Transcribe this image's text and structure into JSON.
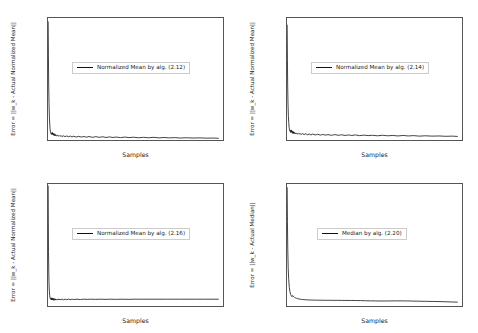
{
  "figure": {
    "panel_count": 4,
    "background": "#ffffff",
    "line_color": "#111111"
  },
  "chart_data": [
    {
      "id": "top-left",
      "type": "line",
      "title": "",
      "xlabel": "Samples",
      "ylabel": "Error = ||w_k - Actual Normalized Mean||",
      "xlim": [
        0,
        2050
      ],
      "ylim": [
        0.0,
        0.87
      ],
      "xticks": [
        0,
        250,
        500,
        750,
        1000,
        1250,
        1500,
        1750,
        2000
      ],
      "xticklabels": [
        "0",
        "250",
        "500",
        "750",
        "1000",
        "1250",
        "1500",
        "1750",
        "2000"
      ],
      "yticks": [
        0.0,
        0.2,
        0.4,
        0.6,
        0.8
      ],
      "yticklabels": [
        "0.0",
        "0.2",
        "0.4",
        "0.6",
        "0.8"
      ],
      "grid": false,
      "legend": {
        "label": "Normalized Mean by alg. (2.12)",
        "position": "center-left"
      },
      "series": [
        {
          "name": "Normalized Mean by alg. (2.12)",
          "x": [
            2,
            5,
            8,
            12,
            16,
            20,
            25,
            30,
            35,
            40,
            45,
            50,
            55,
            60,
            65,
            70,
            75,
            80,
            85,
            90,
            100,
            110,
            120,
            130,
            140,
            150,
            165,
            180,
            200,
            220,
            240,
            260,
            280,
            300,
            330,
            360,
            390,
            420,
            450,
            480,
            520,
            560,
            600,
            640,
            680,
            720,
            760,
            800,
            850,
            900,
            950,
            1000,
            1060,
            1120,
            1180,
            1240,
            1300,
            1360,
            1420,
            1480,
            1550,
            1620,
            1700,
            1780,
            1860,
            1940,
            2000
          ],
          "y": [
            0.845,
            0.6,
            0.4,
            0.26,
            0.17,
            0.115,
            0.075,
            0.055,
            0.045,
            0.05,
            0.038,
            0.055,
            0.04,
            0.048,
            0.034,
            0.046,
            0.032,
            0.042,
            0.03,
            0.038,
            0.029,
            0.035,
            0.027,
            0.033,
            0.026,
            0.031,
            0.025,
            0.03,
            0.024,
            0.029,
            0.023,
            0.028,
            0.022,
            0.027,
            0.021,
            0.026,
            0.021,
            0.025,
            0.02,
            0.025,
            0.019,
            0.024,
            0.019,
            0.023,
            0.018,
            0.022,
            0.018,
            0.021,
            0.017,
            0.021,
            0.017,
            0.02,
            0.016,
            0.019,
            0.016,
            0.019,
            0.015,
            0.018,
            0.015,
            0.017,
            0.014,
            0.016,
            0.014,
            0.015,
            0.013,
            0.014,
            0.012
          ]
        }
      ]
    },
    {
      "id": "top-right",
      "type": "line",
      "title": "",
      "xlabel": "Samples",
      "ylabel": "Error = ||w_k - Actual Normalized Mean||",
      "xlim": [
        0,
        2050
      ],
      "ylim": [
        -0.01,
        0.715
      ],
      "xticks": [
        0,
        250,
        500,
        750,
        1000,
        1250,
        1500,
        1750,
        2000
      ],
      "xticklabels": [
        "0",
        "250",
        "500",
        "750",
        "1000",
        "1250",
        "1500",
        "1750",
        "2000"
      ],
      "yticks": [
        0.0,
        0.1,
        0.2,
        0.3,
        0.4,
        0.5,
        0.6,
        0.7
      ],
      "yticklabels": [
        "0.0",
        "0.1",
        "0.2",
        "0.3",
        "0.4",
        "0.5",
        "0.6",
        "0.7"
      ],
      "grid": false,
      "legend": {
        "label": "Normalized Mean by alg. (2.14)",
        "position": "center-left"
      },
      "series": [
        {
          "name": "Normalized Mean by alg. (2.14)",
          "x": [
            2,
            5,
            8,
            12,
            16,
            20,
            25,
            30,
            35,
            40,
            45,
            50,
            55,
            60,
            65,
            70,
            75,
            80,
            85,
            90,
            100,
            110,
            120,
            130,
            140,
            150,
            165,
            180,
            200,
            220,
            240,
            260,
            280,
            300,
            330,
            360,
            390,
            420,
            450,
            480,
            520,
            560,
            600,
            640,
            680,
            720,
            760,
            800,
            850,
            900,
            950,
            1000,
            1060,
            1120,
            1180,
            1240,
            1300,
            1360,
            1420,
            1480,
            1550,
            1620,
            1700,
            1780,
            1860,
            1940,
            2000
          ],
          "y": [
            0.675,
            0.47,
            0.31,
            0.2,
            0.135,
            0.095,
            0.065,
            0.05,
            0.042,
            0.048,
            0.034,
            0.05,
            0.036,
            0.044,
            0.03,
            0.042,
            0.029,
            0.038,
            0.028,
            0.034,
            0.026,
            0.032,
            0.025,
            0.03,
            0.024,
            0.029,
            0.023,
            0.028,
            0.022,
            0.027,
            0.021,
            0.026,
            0.02,
            0.025,
            0.02,
            0.024,
            0.019,
            0.023,
            0.019,
            0.022,
            0.018,
            0.022,
            0.018,
            0.021,
            0.017,
            0.02,
            0.017,
            0.02,
            0.016,
            0.019,
            0.016,
            0.018,
            0.015,
            0.018,
            0.015,
            0.017,
            0.014,
            0.017,
            0.014,
            0.016,
            0.013,
            0.015,
            0.013,
            0.014,
            0.012,
            0.013,
            0.011
          ]
        }
      ]
    },
    {
      "id": "bottom-left",
      "type": "line",
      "title": "",
      "xlabel": "Samples",
      "ylabel": "Error = ||w_k - Actual Normalized Mean||",
      "xlim": [
        0,
        2050
      ],
      "ylim": [
        0.075,
        0.845
      ],
      "xticks": [
        0,
        250,
        500,
        750,
        1000,
        1250,
        1500,
        1750,
        2000
      ],
      "xticklabels": [
        "0",
        "250",
        "500",
        "750",
        "1000",
        "1250",
        "1500",
        "1750",
        "2000"
      ],
      "yticks": [
        0.1,
        0.2,
        0.3,
        0.4,
        0.5,
        0.6,
        0.7,
        0.8
      ],
      "yticklabels": [
        "0.1",
        "0.2",
        "0.3",
        "0.4",
        "0.5",
        "0.6",
        "0.7",
        "0.8"
      ],
      "grid": false,
      "legend": {
        "label": "Normalized Mean by alg. (2.16)",
        "position": "center-left"
      },
      "series": [
        {
          "name": "Normalized Mean by alg. (2.16)",
          "x": [
            2,
            4,
            6,
            9,
            12,
            16,
            20,
            25,
            30,
            35,
            40,
            45,
            50,
            55,
            60,
            65,
            70,
            75,
            80,
            85,
            90,
            100,
            110,
            120,
            130,
            140,
            150,
            165,
            180,
            200,
            220,
            240,
            260,
            280,
            300,
            340,
            380,
            420,
            460,
            500,
            560,
            620,
            680,
            740,
            800,
            870,
            940,
            1010,
            1080,
            1150,
            1230,
            1310,
            1390,
            1470,
            1550,
            1640,
            1730,
            1820,
            1910,
            2000
          ],
          "y": [
            0.835,
            0.6,
            0.42,
            0.29,
            0.215,
            0.165,
            0.14,
            0.124,
            0.118,
            0.125,
            0.113,
            0.127,
            0.114,
            0.124,
            0.112,
            0.122,
            0.111,
            0.121,
            0.112,
            0.12,
            0.113,
            0.119,
            0.112,
            0.12,
            0.113,
            0.119,
            0.114,
            0.119,
            0.114,
            0.118,
            0.115,
            0.119,
            0.115,
            0.118,
            0.116,
            0.118,
            0.116,
            0.118,
            0.117,
            0.118,
            0.117,
            0.118,
            0.117,
            0.118,
            0.117,
            0.118,
            0.117,
            0.118,
            0.118,
            0.118,
            0.118,
            0.118,
            0.118,
            0.118,
            0.118,
            0.118,
            0.118,
            0.118,
            0.118,
            0.118
          ]
        }
      ]
    },
    {
      "id": "bottom-right",
      "type": "line",
      "title": "",
      "xlabel": "Samples",
      "ylabel": "Error = ||w_k - Actual Median||",
      "xlim": [
        0,
        2050
      ],
      "ylim": [
        -0.2,
        9.3
      ],
      "xticks": [
        0,
        250,
        500,
        750,
        1000,
        1250,
        1500,
        1750,
        2000
      ],
      "xticklabels": [
        "0",
        "250",
        "500",
        "750",
        "1000",
        "1250",
        "1500",
        "1750",
        "2000"
      ],
      "yticks": [
        0,
        2,
        4,
        6,
        8
      ],
      "yticklabels": [
        "0",
        "2",
        "4",
        "6",
        "8"
      ],
      "grid": false,
      "legend": {
        "label": "Median by alg. (2.20)",
        "position": "center-left"
      },
      "series": [
        {
          "name": "Median by alg. (2.20)",
          "x": [
            2,
            5,
            9,
            14,
            20,
            27,
            34,
            42,
            50,
            58,
            66,
            74,
            82,
            90,
            100,
            112,
            125,
            140,
            155,
            172,
            190,
            210,
            232,
            255,
            280,
            310,
            345,
            380,
            420,
            460,
            500,
            545,
            590,
            640,
            690,
            745,
            800,
            860,
            920,
            980,
            1040,
            1100,
            1160,
            1220,
            1280,
            1340,
            1400,
            1470,
            1540,
            1620,
            1700,
            1780,
            1860,
            1930,
            2000
          ],
          "y": [
            9.05,
            6.4,
            4.2,
            2.75,
            1.85,
            1.25,
            0.92,
            0.72,
            0.6,
            0.52,
            0.62,
            0.55,
            0.5,
            0.46,
            0.43,
            0.4,
            0.37,
            0.35,
            0.33,
            0.31,
            0.3,
            0.29,
            0.28,
            0.27,
            0.265,
            0.26,
            0.255,
            0.25,
            0.25,
            0.245,
            0.245,
            0.24,
            0.24,
            0.235,
            0.235,
            0.23,
            0.225,
            0.22,
            0.21,
            0.2,
            0.195,
            0.19,
            0.19,
            0.195,
            0.2,
            0.2,
            0.195,
            0.185,
            0.175,
            0.165,
            0.155,
            0.145,
            0.13,
            0.115,
            0.1
          ]
        }
      ]
    }
  ]
}
